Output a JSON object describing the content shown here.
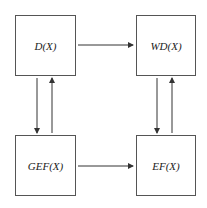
{
  "nodes": {
    "d": {
      "label": "D(X)"
    },
    "wd": {
      "label": "WD(X)"
    },
    "gef": {
      "label": "GEF(X)"
    },
    "ef": {
      "label": "EF(X)"
    }
  },
  "edges": [
    {
      "from": "D(X)",
      "to": "WD(X)"
    },
    {
      "from": "GEF(X)",
      "to": "EF(X)"
    },
    {
      "from": "D(X)",
      "to": "GEF(X)"
    },
    {
      "from": "GEF(X)",
      "to": "D(X)"
    },
    {
      "from": "WD(X)",
      "to": "EF(X)"
    },
    {
      "from": "EF(X)",
      "to": "WD(X)"
    }
  ],
  "colors": {
    "stroke": "#333333",
    "background": "#ffffff"
  }
}
